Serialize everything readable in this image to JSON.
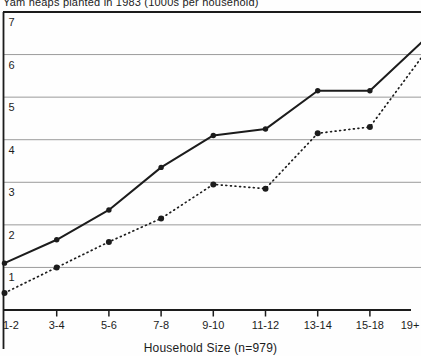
{
  "figure": {
    "title": "Yam heaps planted in 1983 (1000s per household)",
    "x_axis_title": "Household Size (n=979)"
  },
  "chart_data": {
    "type": "line",
    "title": "Yam heaps planted in 1983 (1000s per household)",
    "xlabel": "Household Size (n=979)",
    "ylabel": "",
    "categories": [
      "1-2",
      "3-4",
      "5-6",
      "7-8",
      "9-10",
      "11-12",
      "13-14",
      "15-18",
      "19+"
    ],
    "series": [
      {
        "name": "solid-line",
        "style": "solid",
        "marker": "filled-circle",
        "values": [
          1.1,
          1.65,
          2.35,
          3.35,
          4.1,
          4.25,
          5.15,
          5.15,
          6.3
        ]
      },
      {
        "name": "dotted-line",
        "style": "dotted",
        "marker": "filled-circle",
        "values": [
          0.4,
          1.0,
          1.6,
          2.15,
          2.95,
          2.85,
          4.15,
          4.3,
          5.95
        ]
      }
    ],
    "ylim": [
      0,
      7
    ],
    "yticks": [
      1,
      2,
      3,
      4,
      5,
      6,
      7
    ],
    "grid": true,
    "legend_position": "none",
    "colors": {
      "line": "#1c1c1c",
      "grid": "#9b9b9b",
      "background": "#ffffff"
    }
  }
}
